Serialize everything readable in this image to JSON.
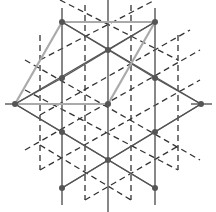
{
  "diagram": {
    "title": "",
    "width": 216,
    "height": 212,
    "colors": {
      "background": "#ffffff",
      "solid_line": "#555555",
      "dashed_line": "#333333",
      "highlight_line": "#aaaaaa",
      "node": "#555555"
    },
    "primary_nodes": [
      {
        "x": 62,
        "y": 22
      },
      {
        "x": 155,
        "y": 22
      },
      {
        "x": 108,
        "y": 50
      },
      {
        "x": 15,
        "y": 104
      },
      {
        "x": 108,
        "y": 104
      },
      {
        "x": 201,
        "y": 104
      },
      {
        "x": 62,
        "y": 78
      },
      {
        "x": 155,
        "y": 78
      },
      {
        "x": 62,
        "y": 132
      },
      {
        "x": 155,
        "y": 132
      },
      {
        "x": 108,
        "y": 160
      },
      {
        "x": 62,
        "y": 188
      },
      {
        "x": 155,
        "y": 188
      }
    ],
    "solid_lines": [
      {
        "x1": 108,
        "y1": 0,
        "x2": 108,
        "y2": 212
      },
      {
        "x1": 62,
        "y1": 8,
        "x2": 62,
        "y2": 205
      },
      {
        "x1": 155,
        "y1": 8,
        "x2": 155,
        "y2": 205
      },
      {
        "x1": 62,
        "y1": 22,
        "x2": 201,
        "y2": 104
      },
      {
        "x1": 15,
        "y1": 104,
        "x2": 155,
        "y2": 22
      },
      {
        "x1": 15,
        "y1": 104,
        "x2": 155,
        "y2": 188
      },
      {
        "x1": 62,
        "y1": 188,
        "x2": 201,
        "y2": 104
      },
      {
        "x1": 62,
        "y1": 22,
        "x2": 155,
        "y2": 78
      },
      {
        "x1": 155,
        "y1": 22,
        "x2": 62,
        "y2": 78
      },
      {
        "x1": 62,
        "y1": 132,
        "x2": 155,
        "y2": 188
      },
      {
        "x1": 155,
        "y1": 132,
        "x2": 62,
        "y2": 188
      },
      {
        "x1": 15,
        "y1": 104,
        "x2": 62,
        "y2": 78
      },
      {
        "x1": 201,
        "y1": 104,
        "x2": 155,
        "y2": 78
      },
      {
        "x1": 15,
        "y1": 104,
        "x2": 62,
        "y2": 132
      },
      {
        "x1": 201,
        "y1": 104,
        "x2": 155,
        "y2": 132
      },
      {
        "x1": 5,
        "y1": 104,
        "x2": 25,
        "y2": 104
      },
      {
        "x1": 191,
        "y1": 104,
        "x2": 212,
        "y2": 104
      }
    ],
    "highlight_lines": [
      {
        "x1": 62,
        "y1": 22,
        "x2": 155,
        "y2": 22
      },
      {
        "x1": 62,
        "y1": 22,
        "x2": 15,
        "y2": 104
      },
      {
        "x1": 155,
        "y1": 22,
        "x2": 108,
        "y2": 104
      },
      {
        "x1": 15,
        "y1": 104,
        "x2": 108,
        "y2": 104
      }
    ],
    "dashed_lines": [
      {
        "x1": 85,
        "y1": 5,
        "x2": 85,
        "y2": 200
      },
      {
        "x1": 131,
        "y1": 5,
        "x2": 131,
        "y2": 200
      },
      {
        "x1": 40,
        "y1": 35,
        "x2": 40,
        "y2": 170
      },
      {
        "x1": 178,
        "y1": 35,
        "x2": 178,
        "y2": 170
      },
      {
        "x1": 40,
        "y1": 60,
        "x2": 155,
        "y2": 0
      },
      {
        "x1": 40,
        "y1": 115,
        "x2": 190,
        "y2": 30
      },
      {
        "x1": 25,
        "y1": 150,
        "x2": 200,
        "y2": 50
      },
      {
        "x1": 40,
        "y1": 170,
        "x2": 200,
        "y2": 80
      },
      {
        "x1": 85,
        "y1": 200,
        "x2": 180,
        "y2": 145
      },
      {
        "x1": 60,
        "y1": 0,
        "x2": 178,
        "y2": 60
      },
      {
        "x1": 25,
        "y1": 60,
        "x2": 200,
        "y2": 160
      },
      {
        "x1": 25,
        "y1": 90,
        "x2": 178,
        "y2": 170
      },
      {
        "x1": 40,
        "y1": 145,
        "x2": 131,
        "y2": 200
      }
    ]
  }
}
